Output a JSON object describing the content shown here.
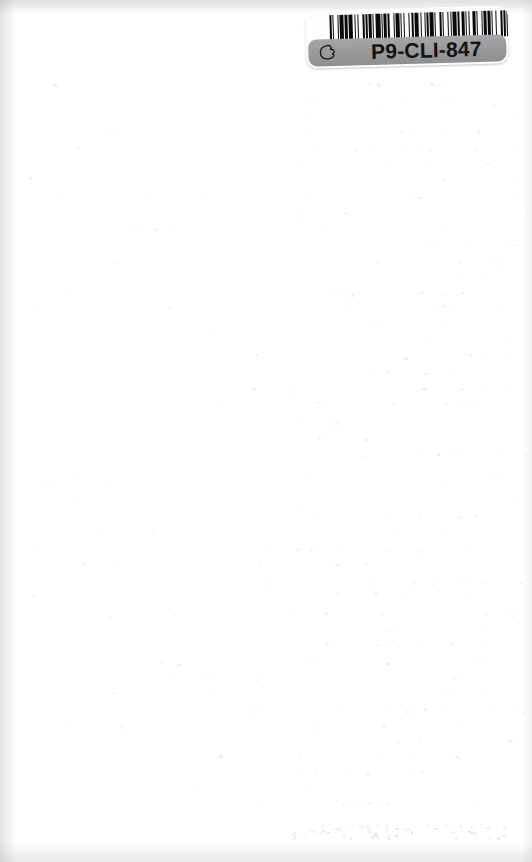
{
  "page": {
    "kind": "scanned-page",
    "background_color": "#ffffff",
    "width": 532,
    "height": 862,
    "body_text": ""
  },
  "barcode_label": {
    "code_text": "P9-CLI-847",
    "symbology": "Code 39",
    "hand_icon_name": "pointing-hand-icon",
    "label_background_color": "#fdfdfd",
    "band_color": "#9a9a9c",
    "bar_color": "#0b0b0b",
    "text_color": "#121212",
    "rotation_degrees": -1.6,
    "bar_widths": [
      2,
      1,
      1,
      3,
      1,
      1,
      4,
      1,
      3,
      1,
      3,
      2,
      1,
      2,
      1,
      4,
      1,
      1,
      2,
      1,
      3,
      1,
      1,
      2,
      4,
      1,
      1,
      1,
      3,
      1,
      2,
      3,
      1,
      1,
      4,
      1,
      1,
      2,
      1,
      3,
      1,
      2,
      2,
      1,
      4,
      1,
      1,
      3,
      1,
      1,
      2,
      1,
      3,
      1,
      1,
      4,
      2,
      1,
      1,
      3,
      1,
      2,
      1,
      1,
      4,
      1,
      2,
      1,
      3,
      1,
      1,
      2,
      1,
      3,
      2,
      1,
      1,
      4,
      1,
      1,
      3,
      1,
      2,
      1,
      1,
      3,
      1,
      4,
      1,
      1,
      2,
      1,
      3,
      1,
      1,
      2,
      4,
      1,
      1,
      2,
      1,
      1,
      3,
      1,
      2,
      1,
      4,
      1,
      1,
      3,
      1,
      1,
      2,
      1,
      3,
      1,
      1,
      4,
      2,
      1,
      1,
      2,
      1,
      3,
      1,
      1,
      2,
      4,
      1,
      1,
      3,
      1,
      1,
      2
    ],
    "bar_colors_alternating": [
      "bar",
      "space"
    ]
  },
  "scan_artifacts": {
    "top_edge_shadow": true,
    "left_edge_shadow": true,
    "bottom_edge_shadow": true,
    "right_edge_shadow": true,
    "bleed_through_visible": true,
    "bleed_through_legible_text": ""
  }
}
